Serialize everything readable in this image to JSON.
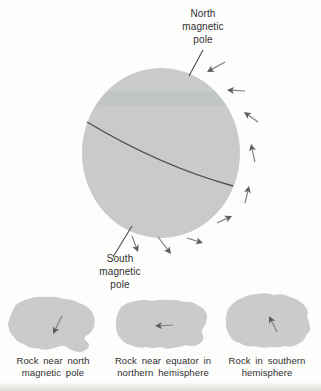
{
  "figure": {
    "labels": {
      "north_pole": "North\nmagnetic\npole",
      "south_pole": "South\nmagnetic\npole",
      "rock_north": "Rock near north\nmagnetic pole",
      "rock_equator": "Rock near equator in\nnorthern hemisphere",
      "rock_south": "Rock in southern\nhemisphere"
    },
    "colors": {
      "background": "#fdfdfb",
      "sphere_fill": "#c8cbc9",
      "rock_fill": "#c9ccca",
      "line": "#4c4c4c",
      "arrow_shaft": "#7e827f",
      "arrow_head": "#5a5e5c",
      "text": "#303030"
    },
    "leader_lines": {
      "north": {
        "from": [
          203,
          50
        ],
        "to": [
          189,
          76
        ]
      },
      "south": {
        "from": [
          132,
          226
        ],
        "to": [
          113,
          257
        ]
      }
    },
    "field_arrows": [
      {
        "tail": [
          225,
          62
        ],
        "head": [
          207,
          72
        ]
      },
      {
        "tail": [
          245,
          91
        ],
        "head": [
          227,
          90
        ]
      },
      {
        "tail": [
          258,
          122
        ],
        "head": [
          244,
          112
        ]
      },
      {
        "tail": [
          255,
          162
        ],
        "head": [
          251,
          144
        ]
      },
      {
        "tail": [
          245,
          203
        ],
        "head": [
          249,
          186
        ]
      },
      {
        "tail": [
          217,
          223
        ],
        "head": [
          232,
          216
        ]
      },
      {
        "tail": [
          187,
          238
        ],
        "head": [
          203,
          243
        ]
      },
      {
        "tail": [
          158,
          237
        ],
        "head": [
          171,
          254
        ]
      },
      {
        "tail": [
          132,
          236
        ],
        "head": [
          138,
          252
        ]
      }
    ],
    "rock_arrows": [
      {
        "tail": [
          62,
          316
        ],
        "head": [
          53,
          334
        ]
      },
      {
        "tail": [
          173,
          325
        ],
        "head": [
          155,
          326
        ]
      },
      {
        "tail": [
          277,
          332
        ],
        "head": [
          269,
          316
        ]
      }
    ]
  }
}
